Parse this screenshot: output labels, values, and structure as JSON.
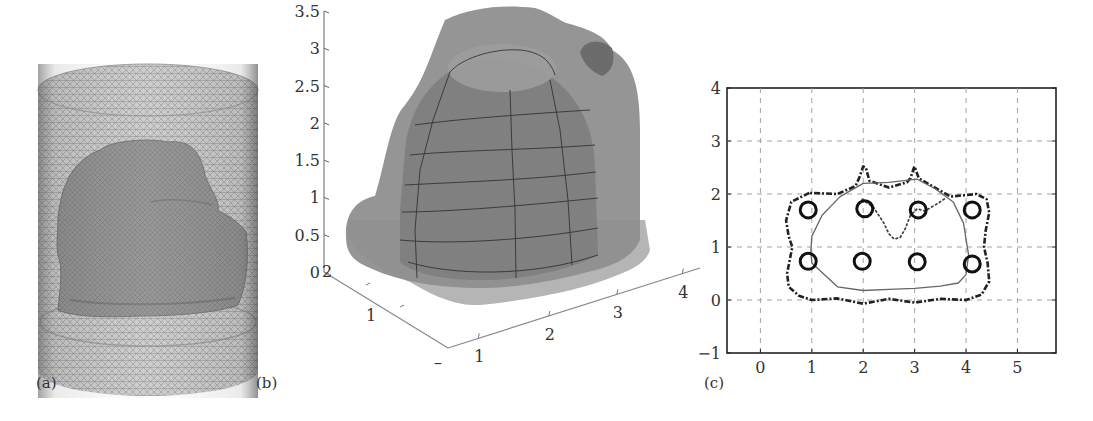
{
  "figure": {
    "panels": [
      {
        "id": "a",
        "label": "(a)",
        "description": "Tetrahedral mesh cylinder enclosing a reconstructed object surface"
      },
      {
        "id": "b",
        "label": "(b)",
        "description": "3D reconstructed surface with wireframe overlay"
      },
      {
        "id": "c",
        "label": "(c)",
        "description": "2D cross-section contours with electrode positions"
      }
    ]
  },
  "colors": {
    "mesh_light": "#bdbdbd",
    "mesh_dark": "#7a7a7a",
    "object_fill": "#8a8a8a",
    "surface_light": "#a8a8a8",
    "surface_mid": "#8c8c8c",
    "surface_dark": "#6e6e6e",
    "base_fill": "#b4b4b4",
    "grid": "#999999",
    "axis": "#333333"
  },
  "chart_data": [
    {
      "type": "surface3d",
      "panel": "b",
      "title": "",
      "zlabel": "",
      "z_ticks": [
        "0",
        "0.5",
        "1",
        "1.5",
        "2",
        "2.5",
        "3",
        "3.5"
      ],
      "zlim": [
        0,
        3.5
      ],
      "y_ticks": [
        "1",
        "2"
      ],
      "y_extra_tick": "–",
      "x_ticks": [
        "1",
        "2",
        "3",
        "4"
      ],
      "grid": false
    },
    {
      "type": "line",
      "panel": "c",
      "title": "",
      "xlabel": "",
      "ylabel": "",
      "xlim": [
        -0.65,
        5.75
      ],
      "ylim": [
        -1,
        4
      ],
      "x_ticks": [
        "0",
        "1",
        "2",
        "3",
        "4",
        "5"
      ],
      "x_tick_values": [
        0,
        1,
        2,
        3,
        4,
        5
      ],
      "y_ticks": [
        "-1",
        "0",
        "1",
        "2",
        "3",
        "4"
      ],
      "y_tick_values": [
        -1,
        0,
        1,
        2,
        3,
        4
      ],
      "grid": true,
      "grid_style": "dashed",
      "legend": "none",
      "electrodes": {
        "marker": "circle",
        "points": [
          {
            "x": 0.93,
            "y": 1.7
          },
          {
            "x": 2.03,
            "y": 1.72
          },
          {
            "x": 3.07,
            "y": 1.7
          },
          {
            "x": 4.12,
            "y": 1.7
          },
          {
            "x": 0.93,
            "y": 0.73
          },
          {
            "x": 1.98,
            "y": 0.73
          },
          {
            "x": 3.05,
            "y": 0.72
          },
          {
            "x": 4.12,
            "y": 0.68
          }
        ]
      },
      "series": [
        {
          "name": "outer-boundary",
          "style": "dash-dot-thick",
          "x": [
            0.95,
            0.6,
            0.5,
            0.55,
            0.62,
            0.58,
            0.52,
            0.55,
            0.75,
            1.0,
            1.5,
            2.0,
            2.5,
            3.0,
            3.5,
            4.0,
            4.3,
            4.45,
            4.42,
            4.35,
            4.38,
            4.45,
            4.4,
            4.2,
            3.7,
            3.25,
            3.08,
            3.0,
            2.98,
            2.92,
            2.85,
            2.5,
            2.12,
            2.05,
            2.0,
            1.92,
            1.85,
            1.5,
            0.95
          ],
          "y": [
            2.02,
            1.85,
            1.5,
            1.2,
            1.0,
            0.8,
            0.5,
            0.25,
            0.08,
            0.0,
            0.03,
            -0.07,
            0.02,
            -0.05,
            0.02,
            0.0,
            0.1,
            0.35,
            0.7,
            1.0,
            1.3,
            1.65,
            1.9,
            2.0,
            1.95,
            2.2,
            2.3,
            2.52,
            2.48,
            2.3,
            2.22,
            2.12,
            2.25,
            2.5,
            2.52,
            2.3,
            2.15,
            2.0,
            2.02
          ]
        },
        {
          "name": "reconstructed-boundary",
          "style": "solid-thin",
          "x": [
            1.55,
            1.2,
            1.0,
            0.98,
            1.0,
            1.5,
            2.0,
            2.5,
            3.0,
            3.5,
            3.85,
            4.0,
            4.05,
            4.0,
            3.95,
            3.75,
            3.4,
            3.05,
            2.5,
            2.0,
            1.55
          ],
          "y": [
            1.95,
            1.6,
            1.2,
            0.9,
            0.7,
            0.25,
            0.18,
            0.2,
            0.22,
            0.26,
            0.32,
            0.48,
            0.85,
            1.15,
            1.45,
            1.85,
            2.1,
            2.28,
            2.22,
            2.2,
            1.95
          ]
        },
        {
          "name": "target-boundary-notch",
          "style": "dotted",
          "x": [
            1.98,
            2.2,
            2.4,
            2.5,
            2.6,
            2.72,
            2.82,
            2.92,
            3.05,
            3.2,
            3.45,
            3.6
          ],
          "y": [
            1.9,
            1.75,
            1.45,
            1.25,
            1.15,
            1.18,
            1.35,
            1.6,
            1.72,
            1.68,
            1.82,
            1.92
          ]
        }
      ]
    }
  ]
}
